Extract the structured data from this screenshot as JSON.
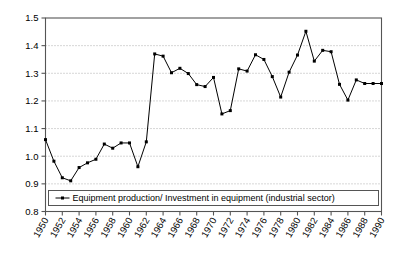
{
  "chart_data": {
    "type": "line",
    "title": "",
    "subtitle": "",
    "xlabel": "",
    "ylabel": "",
    "grid": true,
    "legend_position": "inside-bottom-center",
    "xlim": [
      1950,
      1990
    ],
    "ylim": [
      0.8,
      1.5
    ],
    "yticks": [
      "0.8",
      "0.9",
      "1.0",
      "1.1",
      "1.2",
      "1.3",
      "1.4",
      "1.5"
    ],
    "ytick_values": [
      0.8,
      0.9,
      1.0,
      1.1,
      1.2,
      1.3,
      1.4,
      1.5
    ],
    "xticks": [
      "1950",
      "1952",
      "1954",
      "1956",
      "1958",
      "1960",
      "1962",
      "1964",
      "1966",
      "1968",
      "1970",
      "1972",
      "1974",
      "1976",
      "1978",
      "1980",
      "1982",
      "1984",
      "1986",
      "1988",
      "1990"
    ],
    "xtick_values": [
      1950,
      1952,
      1954,
      1956,
      1958,
      1960,
      1962,
      1964,
      1966,
      1968,
      1970,
      1972,
      1974,
      1976,
      1978,
      1980,
      1982,
      1984,
      1986,
      1988,
      1990
    ],
    "x": [
      1950,
      1951,
      1952,
      1953,
      1954,
      1955,
      1956,
      1957,
      1958,
      1959,
      1960,
      1961,
      1962,
      1963,
      1964,
      1965,
      1966,
      1967,
      1968,
      1969,
      1970,
      1971,
      1972,
      1973,
      1974,
      1975,
      1976,
      1977,
      1978,
      1979,
      1980,
      1981,
      1982,
      1983,
      1984,
      1985,
      1986,
      1987,
      1988,
      1989,
      1990
    ],
    "series": [
      {
        "name": "Equipment production/ Investment in equipment (industrial sector)",
        "marker": "square",
        "color": "#000000",
        "values": [
          1.06,
          0.982,
          0.922,
          0.911,
          0.959,
          0.976,
          0.989,
          1.044,
          1.029,
          1.048,
          1.048,
          0.962,
          1.052,
          1.37,
          1.362,
          1.302,
          1.318,
          1.299,
          1.259,
          1.252,
          1.285,
          1.153,
          1.165,
          1.316,
          1.308,
          1.367,
          1.35,
          1.288,
          1.214,
          1.304,
          1.366,
          1.452,
          1.344,
          1.383,
          1.378,
          1.26,
          1.203,
          1.276,
          1.263,
          1.263,
          1.263
        ]
      }
    ],
    "legend": [
      {
        "label": "Equipment production/ Investment in equipment (industrial sector)"
      }
    ]
  },
  "legend_box": {
    "marker_name": "legend-line-marker"
  }
}
